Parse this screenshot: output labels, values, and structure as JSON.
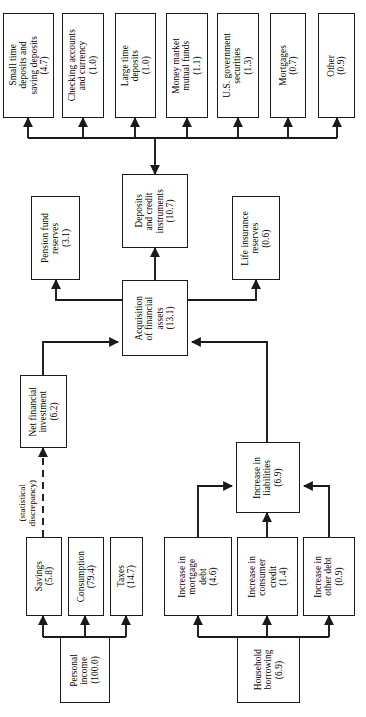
{
  "figure": {
    "type": "flowchart",
    "orientation": "rotated-90-ccw",
    "units_note": "values in parentheses"
  },
  "nodes": {
    "small_time_deposits": {
      "label": "Small time\ndeposits and\nsaving deposits\n(4.7)",
      "value": "4.7",
      "name": "Small time deposits and saving deposits"
    },
    "checking_accounts": {
      "label": "Checking accounts\nand currency\n(1.0)",
      "value": "1.0",
      "name": "Checking accounts and currency"
    },
    "large_time_deposits": {
      "label": "Large time\ndeposits\n(1.0)",
      "value": "1.0",
      "name": "Large time deposits"
    },
    "money_market_funds": {
      "label": "Money market\nmutual funds\n(1.1)",
      "value": "1.1",
      "name": "Money market mutual funds"
    },
    "us_gov_securities": {
      "label": "U.S. government\nsecurities\n(1.3)",
      "value": "1.3",
      "name": "U.S. government securities"
    },
    "mortgages": {
      "label": "Mortgages\n(0.7)",
      "value": "0.7",
      "name": "Mortgages"
    },
    "other": {
      "label": "Other\n(0.9)",
      "value": "0.9",
      "name": "Other"
    },
    "pension_fund_reserves": {
      "label": "Pension fund\nreserves\n(3.1)",
      "value": "3.1",
      "name": "Pension fund reserves"
    },
    "deposits_and_credit": {
      "label": "Deposits\nand credit\ninstruments\n(10.7)",
      "value": "10.7",
      "name": "Deposits and credit instruments"
    },
    "life_insurance_reserves": {
      "label": "Life insurance\nreserves\n(0.6)",
      "value": "0.6",
      "name": "Life insurance reserves"
    },
    "acquisition_financial_assets": {
      "label": "Acquisition\nof financial\nassets\n(13.1)",
      "value": "13.1",
      "name": "Acquisition of financial assets"
    },
    "net_financial_investment": {
      "label": "Net financial\ninvestment\n(6.2)",
      "value": "6.2",
      "name": "Net financial investment"
    },
    "increase_liabilities": {
      "label": "Increase in\nliabilities\n(6.9)",
      "value": "6.9",
      "name": "Increase in liabilities"
    },
    "savings": {
      "label": "Savings\n(5.8)",
      "value": "5.8",
      "name": "Savings"
    },
    "consumption": {
      "label": "Consumption\n(79.4)",
      "value": "79.4",
      "name": "Consumption"
    },
    "taxes": {
      "label": "Taxes\n(14.7)",
      "value": "14.7",
      "name": "Taxes"
    },
    "personal_income": {
      "label": "Personal\nincome\n(100.0)",
      "value": "100.0",
      "name": "Personal income"
    },
    "increase_mortgage_debt": {
      "label": "Increase in\nmortgage\ndebt\n(4.6)",
      "value": "4.6",
      "name": "Increase in mortgage debt"
    },
    "increase_consumer_credit": {
      "label": "Increase in\nconsumer\ncredit\n(1.4)",
      "value": "1.4",
      "name": "Increase in consumer credit"
    },
    "increase_other_debt": {
      "label": "Increase in\nother debt\n(0.9)",
      "value": "0.9",
      "name": "Increase in other debt"
    },
    "household_borrowing": {
      "label": "Household\nborrowing\n(6.9)",
      "value": "6.9",
      "name": "Household borrowing"
    }
  },
  "edge_labels": {
    "statistical_discrepancy": "(statistical\ndiscrepancy)"
  },
  "colors": {
    "stroke": "#1a1a1a",
    "fill": "#ffffff",
    "text": "#000000"
  }
}
